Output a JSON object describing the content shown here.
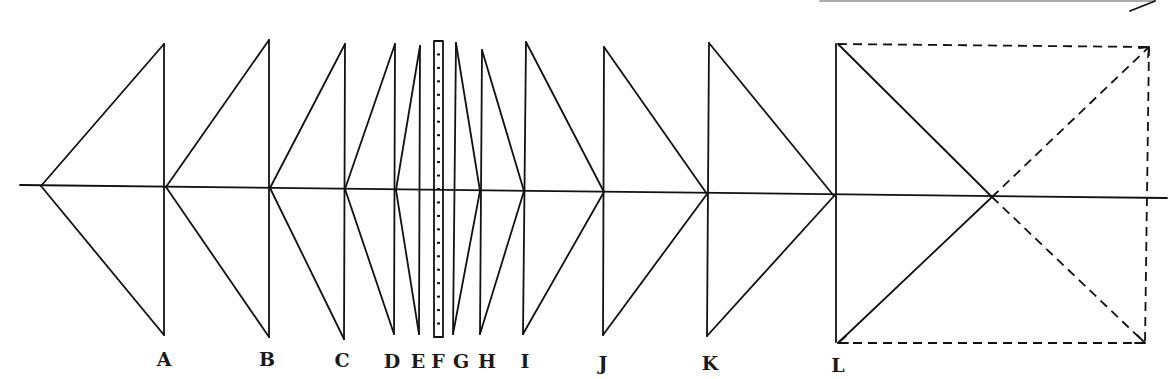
{
  "diagram": {
    "title": "",
    "stroke_color": "#111111",
    "background": "#ffffff",
    "axis": {
      "x1": 20,
      "y1": 185,
      "x2": 1167,
      "y2": 198
    },
    "left_apex": {
      "x": 41,
      "y": 186
    },
    "stations": [
      {
        "label": "A",
        "x_top": 164,
        "y_top": 44,
        "x_bot": 164,
        "y_bot": 335,
        "x_axis": 166,
        "y_axis": 187,
        "label_x": 164,
        "label_y": 366
      },
      {
        "label": "B",
        "x_top": 269,
        "y_top": 40,
        "x_bot": 269,
        "y_bot": 337,
        "x_axis": 270,
        "y_axis": 188,
        "label_x": 267,
        "label_y": 366
      },
      {
        "label": "C",
        "x_top": 345,
        "y_top": 44,
        "x_bot": 344,
        "y_bot": 339,
        "x_axis": 345,
        "y_axis": 189,
        "label_x": 342,
        "label_y": 367
      },
      {
        "label": "D",
        "x_top": 395,
        "y_top": 44,
        "x_bot": 394,
        "y_bot": 334,
        "x_axis": 396,
        "y_axis": 190,
        "label_x": 392,
        "label_y": 368
      },
      {
        "label": "E",
        "x_top": 420,
        "y_top": 46,
        "x_bot": 419,
        "y_bot": 334,
        "x_axis": 420,
        "y_axis": 190,
        "label_x": 418,
        "label_y": 368
      },
      {
        "label": "F",
        "x_top": 434,
        "y_top": 41,
        "x_bot": 443,
        "y_bot": 337,
        "x_axis": 438,
        "y_axis": 190,
        "label_x": 438,
        "label_y": 368
      },
      {
        "label": "G",
        "x_top": 456,
        "y_top": 43,
        "x_bot": 453,
        "y_bot": 334,
        "x_axis": 454,
        "y_axis": 190,
        "label_x": 461,
        "label_y": 368
      },
      {
        "label": "H",
        "x_top": 482,
        "y_top": 50,
        "x_bot": 480,
        "y_bot": 334,
        "x_axis": 480,
        "y_axis": 191,
        "label_x": 487,
        "label_y": 368
      },
      {
        "label": "I",
        "x_top": 526,
        "y_top": 42,
        "x_bot": 523,
        "y_bot": 334,
        "x_axis": 524,
        "y_axis": 191,
        "label_x": 525,
        "label_y": 368
      },
      {
        "label": "J",
        "x_top": 604,
        "y_top": 47,
        "x_bot": 603,
        "y_bot": 335,
        "x_axis": 604,
        "y_axis": 192,
        "label_x": 603,
        "label_y": 370
      },
      {
        "label": "K",
        "x_top": 709,
        "y_top": 43,
        "x_bot": 707,
        "y_bot": 336,
        "x_axis": 707,
        "y_axis": 194,
        "label_x": 710,
        "label_y": 370
      },
      {
        "label": "L",
        "x_top": 836,
        "y_top": 44,
        "x_bot": 836,
        "y_bot": 342,
        "x_axis": 834,
        "y_axis": 196,
        "label_x": 838,
        "label_y": 372
      }
    ],
    "right_box": {
      "top_left": {
        "x": 838,
        "y": 44
      },
      "top_right": {
        "x": 1149,
        "y": 47
      },
      "bottom_right": {
        "x": 1145,
        "y": 343
      },
      "bottom_left": {
        "x": 838,
        "y": 343
      },
      "crossing": {
        "x": 992,
        "y": 197
      }
    },
    "top_arrow": {
      "x1": 820,
      "y1": 1,
      "x2": 1155,
      "y2": 1,
      "head_x": 1130,
      "head_y": 11
    },
    "scale_bar": {
      "x": 434,
      "y": 41,
      "width": 9,
      "height": 296,
      "ticks": 22
    }
  }
}
